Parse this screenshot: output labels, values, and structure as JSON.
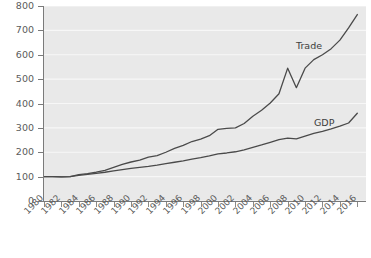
{
  "chart_data": {
    "type": "line",
    "title": "",
    "subtitle": "",
    "xlabel": "",
    "ylabel": "",
    "xlim": [
      1980,
      2017
    ],
    "ylim": [
      0,
      800
    ],
    "grid": true,
    "gridlines_y": [
      0,
      100,
      200,
      300,
      400,
      500,
      600,
      700,
      800
    ],
    "legend_position": "inline-annotation",
    "y_ticks": [
      0,
      100,
      200,
      300,
      400,
      500,
      600,
      700,
      800
    ],
    "y_tick_labels": [
      "0",
      "100",
      "200",
      "300",
      "400",
      "500",
      "600",
      "700",
      "800"
    ],
    "x_ticks": [
      1980,
      1982,
      1984,
      1986,
      1988,
      1990,
      1992,
      1994,
      1996,
      1998,
      2000,
      2002,
      2004,
      2006,
      2008,
      2010,
      2012,
      2014,
      2016
    ],
    "x_tick_labels": [
      "1980",
      "1982",
      "1984",
      "1986",
      "1988",
      "1990",
      "1992",
      "1994",
      "1996",
      "1998",
      "2000",
      "2002",
      "2004",
      "2006",
      "2008",
      "2010",
      "2012",
      "2014",
      "2016"
    ],
    "x": [
      1980,
      1981,
      1982,
      1983,
      1984,
      1985,
      1986,
      1987,
      1988,
      1989,
      1990,
      1991,
      1992,
      1993,
      1994,
      1995,
      1996,
      1997,
      1998,
      1999,
      2000,
      2001,
      2002,
      2003,
      2004,
      2005,
      2006,
      2007,
      2008,
      2009,
      2010,
      2011,
      2012,
      2013,
      2014,
      2015,
      2016
    ],
    "series": [
      {
        "name": "Trade",
        "color": "#4a4a4a",
        "values": [
          100,
          100,
          99,
          100,
          108,
          112,
          118,
          126,
          138,
          150,
          160,
          168,
          180,
          186,
          200,
          216,
          228,
          244,
          254,
          268,
          294,
          298,
          300,
          318,
          348,
          372,
          402,
          440,
          545,
          465,
          545,
          580,
          600,
          625,
          660,
          710,
          765
        ]
      },
      {
        "name": "GDP",
        "color": "#4a4a4a",
        "values": [
          100,
          100,
          99,
          100,
          105,
          109,
          113,
          118,
          124,
          129,
          134,
          138,
          142,
          147,
          153,
          159,
          165,
          172,
          178,
          185,
          193,
          197,
          202,
          210,
          220,
          230,
          241,
          252,
          258,
          255,
          266,
          277,
          286,
          296,
          307,
          320,
          360
        ]
      }
    ],
    "annotations": [
      {
        "text": "Trade",
        "x": 2013,
        "y": 660
      },
      {
        "text": "GDP",
        "x": 2015,
        "y": 420
      }
    ]
  }
}
